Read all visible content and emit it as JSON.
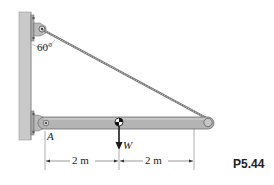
{
  "figure": {
    "problem_number": "P5.44",
    "angle_label": "60°",
    "point_label": "A",
    "load_label": "W",
    "dimensions": [
      {
        "label": "2 m",
        "from": "A",
        "to": "W"
      },
      {
        "label": "2 m",
        "from": "W",
        "to": "end"
      }
    ]
  },
  "colors": {
    "wall": "#c9c9c9",
    "wall_edge": "#9a9a9a",
    "beam": "#b4b4b4",
    "beam_edge": "#6f6f6f",
    "cable": "#8a8a8a",
    "arrow": "#1a1a1a",
    "text": "#222222"
  }
}
